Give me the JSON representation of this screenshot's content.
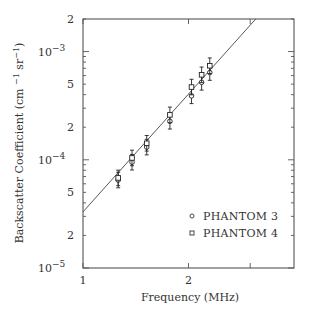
{
  "chart_data": {
    "type": "scatter",
    "title": "",
    "xlabel": "Frequency (MHz)",
    "ylabel": "Backscatter Coefficient (cm⁻¹ sr⁻¹)",
    "xscale": "log",
    "yscale": "log",
    "xlim": [
      1,
      4
    ],
    "ylim": [
      1e-05,
      0.002
    ],
    "grid": false,
    "legend_position": "lower right",
    "x_ticks": [
      {
        "value": 1,
        "label": "1"
      },
      {
        "value": 2,
        "label": "2"
      },
      {
        "value": 3,
        "label": ""
      }
    ],
    "y_ticks": [
      {
        "value": 0.002,
        "label": "2"
      },
      {
        "value": 0.001,
        "label": "10",
        "exp": "−3"
      },
      {
        "value": 0.0005,
        "label": "5"
      },
      {
        "value": 0.0002,
        "label": "2"
      },
      {
        "value": 0.0001,
        "label": "10",
        "exp": "−4"
      },
      {
        "value": 5e-05,
        "label": "5"
      },
      {
        "value": 2e-05,
        "label": "2"
      },
      {
        "value": 1e-05,
        "label": "10",
        "exp": "−5"
      }
    ],
    "series": [
      {
        "name": "PHANTOM 3",
        "marker": "circle",
        "x": [
          1.26,
          1.38,
          1.52,
          1.77,
          2.04,
          2.18,
          2.3
        ],
        "y": [
          6.5e-05,
          9.5e-05,
          0.000131,
          0.000227,
          0.00039,
          0.00052,
          0.00064
        ],
        "err_factor": 1.18
      },
      {
        "name": "PHANTOM 4",
        "marker": "square",
        "x": [
          1.26,
          1.38,
          1.52,
          1.77,
          2.04,
          2.18,
          2.3
        ],
        "y": [
          6.8e-05,
          0.000104,
          0.000142,
          0.00026,
          0.00047,
          0.00061,
          0.00074
        ],
        "err_factor": 1.18
      }
    ],
    "fit_line": {
      "label": "power-law fit",
      "x": [
        1,
        3.11
      ],
      "y": [
        3.3e-05,
        0.002
      ]
    }
  },
  "legend": {
    "items": [
      {
        "label": "PHANTOM 3",
        "marker": "circle"
      },
      {
        "label": "PHANTOM 4",
        "marker": "square"
      }
    ]
  },
  "colors": {
    "axis": "#555555",
    "marker": "#222222",
    "line": "#444444",
    "text": "#333333"
  }
}
